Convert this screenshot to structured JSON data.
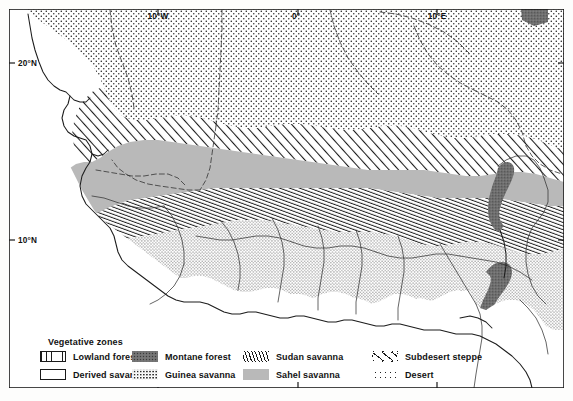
{
  "figure": {
    "background_color": "#fdfdfc",
    "frame_color": "#1a1a1a"
  },
  "axes": {
    "top_labels": [
      {
        "text": "10°W",
        "x": 158,
        "y": 18
      },
      {
        "text": "0°",
        "x": 295,
        "y": 18
      },
      {
        "text": "10°E",
        "x": 432,
        "y": 18
      }
    ],
    "left_labels": [
      {
        "text": "20°N",
        "x": 20,
        "y": 63
      },
      {
        "text": "10°N",
        "x": 20,
        "y": 240
      }
    ]
  },
  "legend": {
    "title": "Vegetative zones",
    "columns": [
      {
        "items": [
          {
            "label": "Lowland forest",
            "pattern": "vertical-lines",
            "swatch_class": "sw-lowland",
            "bordered": true
          },
          {
            "label": "Derived savanna",
            "pattern": "blank-white",
            "swatch_class": "sw-derived",
            "bordered": true
          }
        ]
      },
      {
        "items": [
          {
            "label": "Montane forest",
            "pattern": "dark-solid-stipple",
            "swatch_class": "sw-montane",
            "bordered": false
          },
          {
            "label": "Guinea savanna",
            "pattern": "fine-stipple",
            "swatch_class": "sw-guinea",
            "bordered": false
          }
        ]
      },
      {
        "items": [
          {
            "label": "Sudan savanna",
            "pattern": "steep-diagonal-hatch",
            "swatch_class": "sw-sudan",
            "bordered": false
          },
          {
            "label": "Sahel savanna",
            "pattern": "solid-gray",
            "swatch_class": "sw-sahel",
            "bordered": false
          }
        ]
      },
      {
        "items": [
          {
            "label": "Subdesert steppe",
            "pattern": "wide-diagonal-hatch",
            "swatch_class": "sw-subdesert",
            "bordered": false
          },
          {
            "label": "Desert",
            "pattern": "coarse-dots",
            "swatch_class": "sw-desert",
            "bordered": false
          }
        ]
      }
    ]
  },
  "zones": [
    {
      "name": "Desert",
      "fill": "coarse-dots",
      "color": "#ffffff"
    },
    {
      "name": "Subdesert steppe",
      "fill": "wide-diagonal-hatch",
      "color": "#ffffff"
    },
    {
      "name": "Sahel savanna",
      "fill": "solid-gray",
      "color": "#b9b9b9"
    },
    {
      "name": "Sudan savanna",
      "fill": "steep-diagonal-hatch",
      "color": "#ffffff"
    },
    {
      "name": "Guinea savanna",
      "fill": "fine-stipple",
      "color": "#ffffff"
    },
    {
      "name": "Derived savanna",
      "fill": "blank-white",
      "color": "#ffffff"
    },
    {
      "name": "Lowland forest",
      "fill": "vertical-lines",
      "color": "#ffffff"
    },
    {
      "name": "Montane forest",
      "fill": "dark-solid-stipple",
      "color": "#6f6f6f"
    }
  ]
}
